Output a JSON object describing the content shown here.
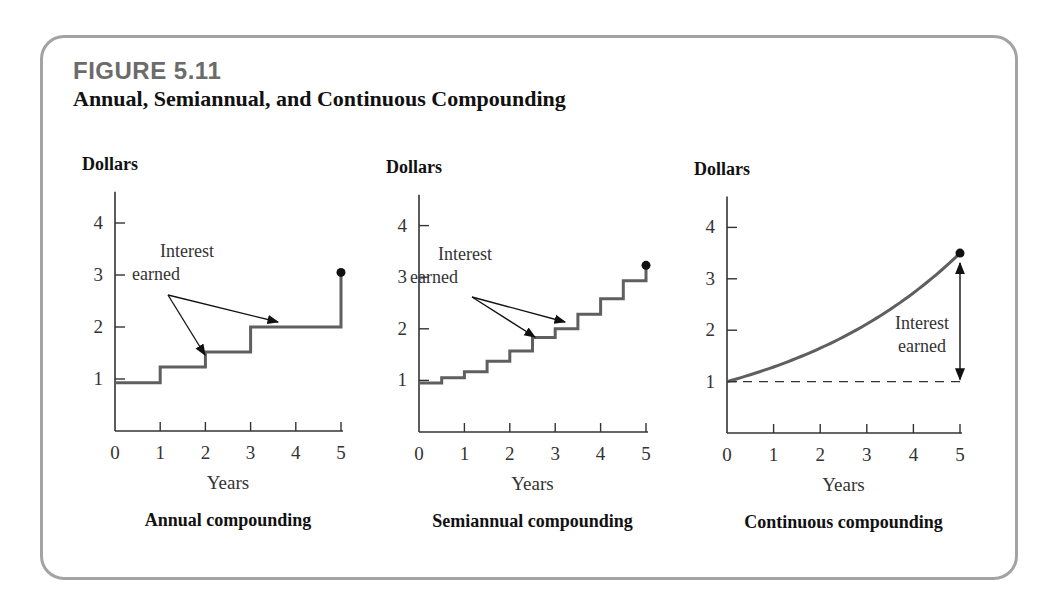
{
  "figure": {
    "label": "FIGURE 5.11",
    "title": "Annual, Semiannual, and Continuous Compounding"
  },
  "colors": {
    "frame": "#a3a3a3",
    "line": "#5f5f5f",
    "axis": "#333333",
    "label_grey": "#6b6b6b"
  },
  "chart_data": [
    {
      "type": "line",
      "step": true,
      "title": "Annual compounding",
      "xlabel": "Years",
      "ylabel": "Dollars",
      "xticks": [
        0,
        1,
        2,
        3,
        4,
        5
      ],
      "yticks": [
        1,
        2,
        3,
        4
      ],
      "xlim": [
        0,
        5
      ],
      "ylim": [
        0,
        4.6
      ],
      "x": [
        0,
        1,
        2,
        3,
        4,
        5
      ],
      "values": [
        0.93,
        1.23,
        1.52,
        2.0,
        2.0,
        2.5
      ],
      "end_point": [
        5,
        3.05
      ],
      "annotation": "Interest earned",
      "annotation_lines": [
        "Interest",
        "earned"
      ]
    },
    {
      "type": "line",
      "step": true,
      "title": "Semiannual compounding",
      "xlabel": "Years",
      "ylabel": "Dollars",
      "xticks": [
        0,
        1,
        2,
        3,
        4,
        5
      ],
      "yticks": [
        1,
        2,
        3,
        4
      ],
      "xlim": [
        0,
        5
      ],
      "ylim": [
        0,
        4.6
      ],
      "x": [
        0,
        0.5,
        1,
        1.5,
        2,
        2.5,
        3,
        3.5,
        4,
        4.5,
        5
      ],
      "values": [
        0.95,
        1.05,
        1.17,
        1.37,
        1.57,
        1.83,
        2.0,
        2.28,
        2.58,
        2.93,
        3.23
      ],
      "end_point": [
        5,
        3.23
      ],
      "annotation": "Interest earned",
      "annotation_lines": [
        "Interest",
        "earned"
      ]
    },
    {
      "type": "line",
      "step": false,
      "title": "Continuous compounding",
      "xlabel": "Years",
      "ylabel": "Dollars",
      "xticks": [
        0,
        1,
        2,
        3,
        4,
        5
      ],
      "yticks": [
        1,
        2,
        3,
        4
      ],
      "xlim": [
        0,
        5
      ],
      "ylim": [
        0,
        4.6
      ],
      "x": [
        0,
        1,
        2,
        3,
        4,
        5
      ],
      "values": [
        1.0,
        1.28,
        1.65,
        2.12,
        2.72,
        3.5
      ],
      "end_point": [
        5,
        3.5
      ],
      "reference_line": 1.0,
      "annotation": "Interest earned",
      "annotation_lines": [
        "Interest",
        "earned"
      ]
    }
  ],
  "panels": [
    {
      "ox": 115,
      "oy": 431,
      "xs": 45.2,
      "ys": 52.0,
      "ann_x": 160,
      "ann_y": 257,
      "ann_src": [
        168,
        295
      ],
      "arrows": [
        [
          205,
          355
        ],
        [
          278,
          322
        ]
      ]
    },
    {
      "ox": 419,
      "oy": 432,
      "xs": 45.4,
      "ys": 51.6,
      "ann_x": 438,
      "ann_y": 260,
      "ann_src": [
        472,
        297
      ],
      "arrows": [
        [
          535,
          337
        ],
        [
          565,
          322
        ]
      ]
    },
    {
      "ox": 727,
      "oy": 433,
      "xs": 46.6,
      "ys": 51.4,
      "ann_x": 922,
      "ann_y": 329,
      "ann_src": null,
      "arrows": []
    }
  ]
}
